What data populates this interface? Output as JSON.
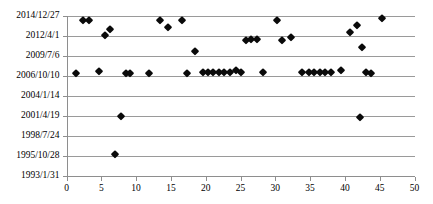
{
  "chart_data": {
    "type": "scatter",
    "title": "",
    "xlabel": "",
    "ylabel": "",
    "xlim": [
      0,
      50
    ],
    "xticks": [
      0,
      5,
      10,
      15,
      20,
      25,
      30,
      35,
      40,
      45,
      50
    ],
    "yticks": [
      "1993/1/31",
      "1995/10/28",
      "1998/7/24",
      "2001/4/19",
      "2004/1/14",
      "2006/10/10",
      "2009/7/6",
      "2012/4/1",
      "2014/12/27"
    ],
    "grid": true,
    "legend": null,
    "marker": "diamond",
    "marker_color": "#0a0a0a",
    "points": [
      {
        "x": 1.3,
        "y": "2007/2/20"
      },
      {
        "x": 2.3,
        "y": "2014/6/5"
      },
      {
        "x": 3.2,
        "y": "2014/6/5"
      },
      {
        "x": 4.6,
        "y": "2007/5/1"
      },
      {
        "x": 5.6,
        "y": "2012/4/20"
      },
      {
        "x": 6.2,
        "y": "2013/2/10"
      },
      {
        "x": 6.9,
        "y": "1995/12/20"
      },
      {
        "x": 7.9,
        "y": "2001/4/19"
      },
      {
        "x": 8.6,
        "y": "2007/2/20"
      },
      {
        "x": 9.1,
        "y": "2007/2/20"
      },
      {
        "x": 11.9,
        "y": "2007/2/20"
      },
      {
        "x": 13.4,
        "y": "2014/6/5"
      },
      {
        "x": 14.6,
        "y": "2013/6/1"
      },
      {
        "x": 16.6,
        "y": "2014/6/5"
      },
      {
        "x": 17.3,
        "y": "2007/2/20"
      },
      {
        "x": 18.5,
        "y": "2010/3/1"
      },
      {
        "x": 19.6,
        "y": "2007/3/20"
      },
      {
        "x": 20.3,
        "y": "2007/3/20"
      },
      {
        "x": 21.1,
        "y": "2007/3/20"
      },
      {
        "x": 21.9,
        "y": "2007/3/20"
      },
      {
        "x": 22.7,
        "y": "2007/3/20"
      },
      {
        "x": 23.5,
        "y": "2007/3/20"
      },
      {
        "x": 24.3,
        "y": "2007/6/20"
      },
      {
        "x": 25.1,
        "y": "2007/3/20"
      },
      {
        "x": 25.8,
        "y": "2011/8/1"
      },
      {
        "x": 26.5,
        "y": "2011/11/1"
      },
      {
        "x": 27.3,
        "y": "2011/11/1"
      },
      {
        "x": 28.3,
        "y": "2007/3/20"
      },
      {
        "x": 30.2,
        "y": "2014/6/5"
      },
      {
        "x": 31.0,
        "y": "2011/8/1"
      },
      {
        "x": 32.2,
        "y": "2012/1/1"
      },
      {
        "x": 33.9,
        "y": "2007/3/20"
      },
      {
        "x": 34.8,
        "y": "2007/3/20"
      },
      {
        "x": 35.6,
        "y": "2007/3/20"
      },
      {
        "x": 36.4,
        "y": "2007/3/20"
      },
      {
        "x": 37.2,
        "y": "2007/3/20"
      },
      {
        "x": 38.0,
        "y": "2007/3/20"
      },
      {
        "x": 39.5,
        "y": "2007/6/20"
      },
      {
        "x": 40.8,
        "y": "2012/10/1"
      },
      {
        "x": 41.8,
        "y": "2013/9/1"
      },
      {
        "x": 42.2,
        "y": "2001/1/10"
      },
      {
        "x": 42.5,
        "y": "2010/9/1"
      },
      {
        "x": 43.0,
        "y": "2007/3/20"
      },
      {
        "x": 43.7,
        "y": "2007/2/20"
      },
      {
        "x": 45.3,
        "y": "2014/9/1"
      }
    ]
  }
}
